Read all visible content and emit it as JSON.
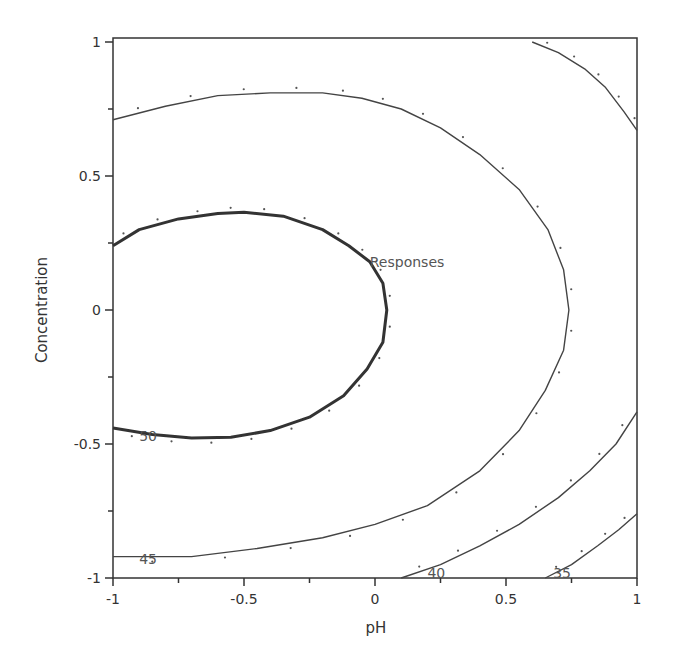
{
  "chart_data": {
    "type": "contour",
    "title": "",
    "xlabel": "pH",
    "ylabel": "Concentration",
    "xlim": [
      -1,
      1
    ],
    "ylim": [
      -1,
      1
    ],
    "grid": false,
    "xticks": [
      {
        "value": -1,
        "label": "-1"
      },
      {
        "value": -0.5,
        "label": "-0.5"
      },
      {
        "value": 0,
        "label": "0"
      },
      {
        "value": 0.5,
        "label": "0.5"
      },
      {
        "value": 1,
        "label": "1"
      }
    ],
    "yticks": [
      {
        "value": -1,
        "label": "-1"
      },
      {
        "value": -0.5,
        "label": "-0.5"
      },
      {
        "value": 0,
        "label": "0"
      },
      {
        "value": 0.5,
        "label": "0.5"
      },
      {
        "value": 1,
        "label": "1"
      }
    ],
    "annotation": "Responses",
    "contours": [
      {
        "level": 50,
        "label": "50",
        "bold": true,
        "points": [
          [
            -1,
            0.24
          ],
          [
            -0.9,
            0.3
          ],
          [
            -0.75,
            0.34
          ],
          [
            -0.6,
            0.36
          ],
          [
            -0.5,
            0.365
          ],
          [
            -0.35,
            0.35
          ],
          [
            -0.2,
            0.3
          ],
          [
            -0.1,
            0.24
          ],
          [
            -0.02,
            0.18
          ],
          [
            0.03,
            0.1
          ],
          [
            0.045,
            0.0
          ],
          [
            0.03,
            -0.12
          ],
          [
            -0.03,
            -0.22
          ],
          [
            -0.12,
            -0.32
          ],
          [
            -0.25,
            -0.4
          ],
          [
            -0.4,
            -0.45
          ],
          [
            -0.55,
            -0.475
          ],
          [
            -0.7,
            -0.478
          ],
          [
            -0.85,
            -0.465
          ],
          [
            -1,
            -0.44
          ]
        ]
      },
      {
        "level": 45,
        "label": "45",
        "bold": false,
        "points": [
          [
            -1,
            0.71
          ],
          [
            -0.8,
            0.76
          ],
          [
            -0.6,
            0.8
          ],
          [
            -0.4,
            0.81
          ],
          [
            -0.2,
            0.81
          ],
          [
            -0.05,
            0.79
          ],
          [
            0.1,
            0.75
          ],
          [
            0.25,
            0.68
          ],
          [
            0.4,
            0.58
          ],
          [
            0.55,
            0.45
          ],
          [
            0.66,
            0.3
          ],
          [
            0.72,
            0.15
          ],
          [
            0.74,
            0.0
          ],
          [
            0.72,
            -0.15
          ],
          [
            0.65,
            -0.3
          ],
          [
            0.55,
            -0.45
          ],
          [
            0.4,
            -0.6
          ],
          [
            0.2,
            -0.73
          ],
          [
            0.0,
            -0.8
          ],
          [
            -0.2,
            -0.85
          ],
          [
            -0.45,
            -0.89
          ],
          [
            -0.7,
            -0.92
          ],
          [
            -1,
            -0.92
          ]
        ]
      },
      {
        "level": 45,
        "label": "",
        "bold": false,
        "points": [
          [
            0.6,
            1.0
          ],
          [
            0.7,
            0.96
          ],
          [
            0.8,
            0.9
          ],
          [
            0.88,
            0.83
          ],
          [
            0.95,
            0.74
          ],
          [
            1.0,
            0.67
          ]
        ]
      },
      {
        "level": 40,
        "label": "40",
        "bold": false,
        "points": [
          [
            0.1,
            -1.0
          ],
          [
            0.25,
            -0.95
          ],
          [
            0.4,
            -0.88
          ],
          [
            0.55,
            -0.8
          ],
          [
            0.7,
            -0.7
          ],
          [
            0.82,
            -0.6
          ],
          [
            0.92,
            -0.5
          ],
          [
            1.0,
            -0.38
          ]
        ]
      },
      {
        "level": 35,
        "label": "35",
        "bold": false,
        "points": [
          [
            0.65,
            -1.0
          ],
          [
            0.75,
            -0.95
          ],
          [
            0.85,
            -0.88
          ],
          [
            0.93,
            -0.82
          ],
          [
            1.0,
            -0.76
          ]
        ]
      }
    ],
    "label_positions": [
      {
        "text": "50",
        "x": -0.9,
        "y": -0.47
      },
      {
        "text": "45",
        "x": -0.9,
        "y": -0.93
      },
      {
        "text": "40",
        "x": 0.2,
        "y": -0.98
      },
      {
        "text": "35",
        "x": 0.68,
        "y": -0.98
      },
      {
        "text": "Responses",
        "x": -0.02,
        "y": 0.18
      }
    ]
  },
  "plot_area": {
    "left": 113,
    "right": 637,
    "top": 42,
    "bottom": 578
  },
  "colors": {
    "line": "#444444",
    "bold_line": "#333333",
    "dots": "#555555",
    "axis": "#333333"
  }
}
